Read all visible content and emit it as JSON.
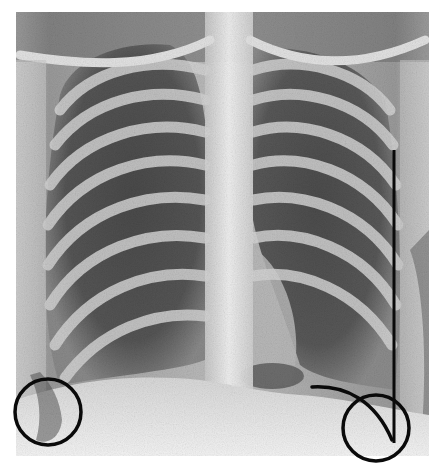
{
  "image": {
    "type": "chest-radiograph",
    "view": "PA",
    "background": "#ffffff",
    "film_dark": "#3a3a3a",
    "film_mid": "#8a8a8a",
    "film_light": "#e6e6e6",
    "ink": "#0a0a0a"
  },
  "annotations": [
    {
      "kind": "circle",
      "label": "right-costophrenic-angle",
      "cx": 48,
      "cy": 412,
      "r": 33
    },
    {
      "kind": "circle",
      "label": "left-costophrenic-angle",
      "cx": 376,
      "cy": 428,
      "r": 33
    },
    {
      "kind": "vertical-line",
      "label": "left-lateral-chest-wall-marker",
      "x": 394,
      "y1": 150,
      "y2": 443
    },
    {
      "kind": "curve",
      "label": "left-hemidiaphragm-outline",
      "from": [
        312,
        387
      ],
      "to": [
        392,
        440
      ]
    }
  ]
}
